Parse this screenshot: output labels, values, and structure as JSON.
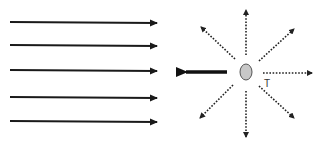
{
  "diagram": {
    "incident_waves": {
      "count": 5,
      "direction": "right",
      "style": "solid",
      "color": "#1a1a1a"
    },
    "particle": {
      "shape": "ellipse",
      "fill": "#c8c8c8",
      "stroke": "#555555"
    },
    "recoil_arrow": {
      "direction": "left",
      "style": "solid-thick",
      "color": "#111111"
    },
    "scattered_waves": {
      "directions": [
        "up",
        "up-right",
        "right",
        "down-right",
        "down",
        "down-left",
        "up-left"
      ],
      "style": "dotted",
      "color": "#222222"
    },
    "labels": {
      "transmitted": "T"
    }
  }
}
